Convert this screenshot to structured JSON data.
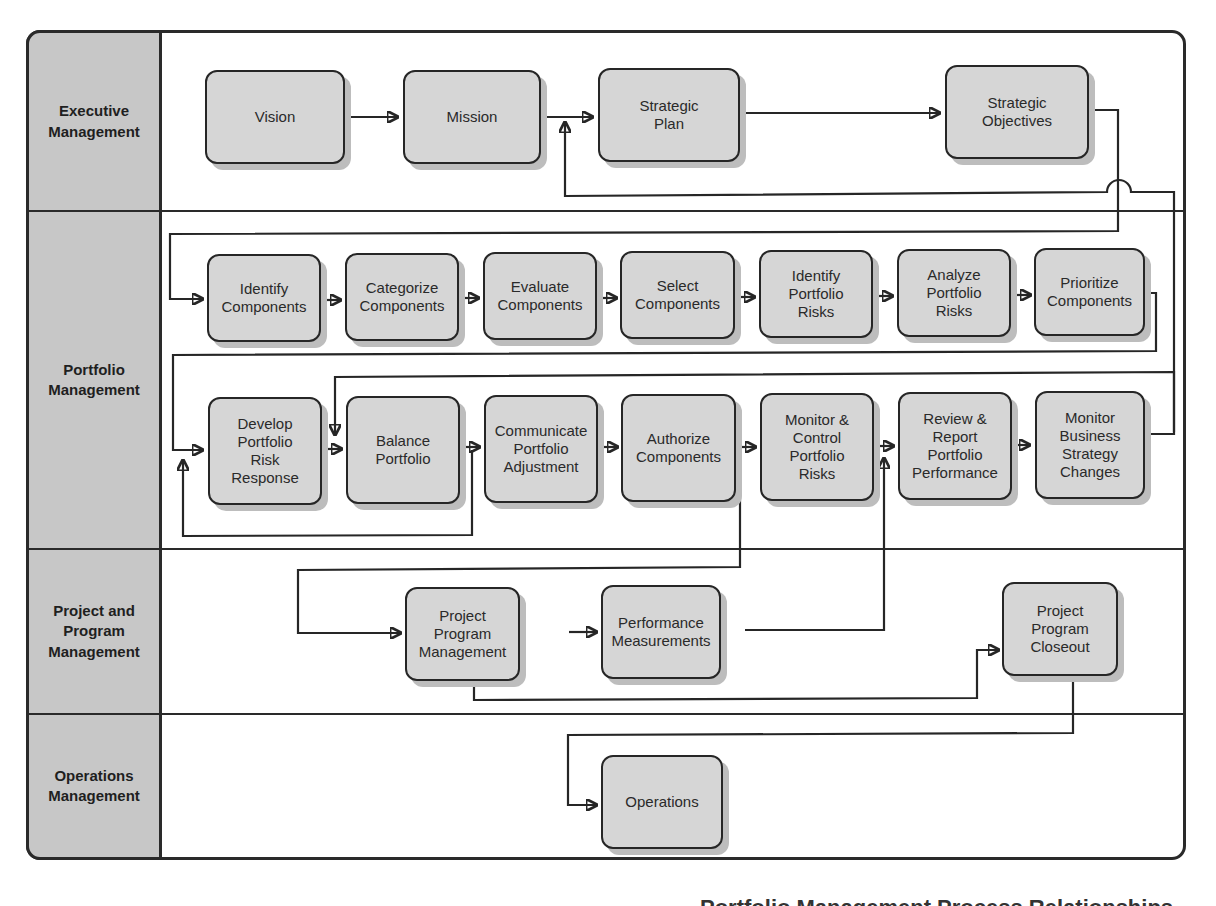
{
  "diagram": {
    "type": "swimlane-flowchart",
    "lanes": [
      {
        "id": "executive",
        "label": "Executive\nManagement"
      },
      {
        "id": "portfolio",
        "label": "Portfolio\nManagement"
      },
      {
        "id": "project",
        "label": "Project and\nProgram\nManagement"
      },
      {
        "id": "operations",
        "label": "Operations\nManagement"
      }
    ],
    "nodes": {
      "vision": "Vision",
      "mission": "Mission",
      "strategic_plan": "Strategic\nPlan",
      "strategic_objectives": "Strategic\nObjectives",
      "identify_components": "Identify\nComponents",
      "categorize_components": "Categorize\nComponents",
      "evaluate_components": "Evaluate\nComponents",
      "select_components": "Select\nComponents",
      "identify_portfolio_risks": "Identify\nPortfolio\nRisks",
      "analyze_portfolio_risks": "Analyze\nPortfolio\nRisks",
      "prioritize_components": "Prioritize\nComponents",
      "develop_portfolio_risk_response": "Develop\nPortfolio\nRisk\nResponse",
      "balance_portfolio": "Balance\nPortfolio",
      "communicate_portfolio_adjustment": "Communicate\nPortfolio\nAdjustment",
      "authorize_components": "Authorize\nComponents",
      "monitor_control_portfolio_risks": "Monitor &\nControl\nPortfolio\nRisks",
      "review_report_portfolio_performance": "Review &\nReport\nPortfolio\nPerformance",
      "monitor_business_strategy_changes": "Monitor\nBusiness\nStrategy\nChanges",
      "project_program_management": "Project\nProgram\nManagement",
      "performance_measurements": "Performance\nMeasurements",
      "project_program_closeout": "Project\nProgram\nCloseout",
      "operations": "Operations"
    },
    "edges": [
      [
        "vision",
        "mission"
      ],
      [
        "mission",
        "strategic_plan"
      ],
      [
        "strategic_plan",
        "strategic_objectives"
      ],
      [
        "strategic_objectives",
        "identify_components"
      ],
      [
        "identify_components",
        "categorize_components"
      ],
      [
        "categorize_components",
        "evaluate_components"
      ],
      [
        "evaluate_components",
        "select_components"
      ],
      [
        "select_components",
        "identify_portfolio_risks"
      ],
      [
        "identify_portfolio_risks",
        "analyze_portfolio_risks"
      ],
      [
        "analyze_portfolio_risks",
        "prioritize_components"
      ],
      [
        "prioritize_components",
        "develop_portfolio_risk_response"
      ],
      [
        "develop_portfolio_risk_response",
        "balance_portfolio"
      ],
      [
        "balance_portfolio",
        "communicate_portfolio_adjustment"
      ],
      [
        "balance_portfolio",
        "develop_portfolio_risk_response"
      ],
      [
        "communicate_portfolio_adjustment",
        "authorize_components"
      ],
      [
        "authorize_components",
        "monitor_control_portfolio_risks"
      ],
      [
        "authorize_components",
        "project_program_management"
      ],
      [
        "monitor_control_portfolio_risks",
        "review_report_portfolio_performance"
      ],
      [
        "review_report_portfolio_performance",
        "monitor_business_strategy_changes"
      ],
      [
        "monitor_business_strategy_changes",
        "strategic_plan"
      ],
      [
        "monitor_business_strategy_changes",
        "balance_portfolio"
      ],
      [
        "project_program_management",
        "performance_measurements"
      ],
      [
        "project_program_management",
        "project_program_closeout"
      ],
      [
        "performance_measurements",
        "review_report_portfolio_performance"
      ],
      [
        "project_program_closeout",
        "operations"
      ]
    ]
  },
  "caption": "Portfolio Management Process Relationships"
}
